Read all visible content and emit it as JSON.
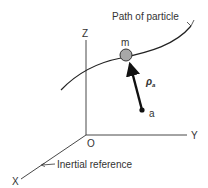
{
  "diagram": {
    "path_label": "Path of particle",
    "axes": {
      "z": "Z",
      "y": "Y",
      "x": "X",
      "origin": "O"
    },
    "particle_label": "m",
    "point_label": "a",
    "vector_label": "ρ",
    "vector_subscript": "a",
    "frame_label": "Inertial reference",
    "colors": {
      "line": "#222222",
      "particle_fill": "#a8a8a8",
      "text": "#333333"
    }
  }
}
